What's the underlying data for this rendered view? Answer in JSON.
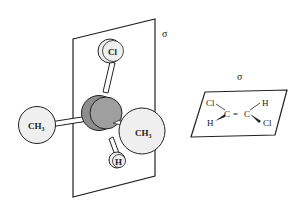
{
  "figure": {
    "left_molecule": {
      "plane_label": "σ",
      "atoms": {
        "top": "Cl",
        "left": "CH",
        "left_sub": "3",
        "right": "CH",
        "right_sub": "3",
        "bottom": "H"
      }
    },
    "right_molecule": {
      "plane_label": "σ",
      "atoms": {
        "top_left": "Cl",
        "bottom_left": "H",
        "c1": "C",
        "double_bond": "=",
        "c2": "C",
        "top_right": "H",
        "bottom_right": "Cl"
      }
    },
    "colors": {
      "line": "#222222",
      "atom_fill": "#efefef",
      "central_atom_fill": "#8e8e8e",
      "central_atom_front": "#a0a0a0"
    }
  }
}
